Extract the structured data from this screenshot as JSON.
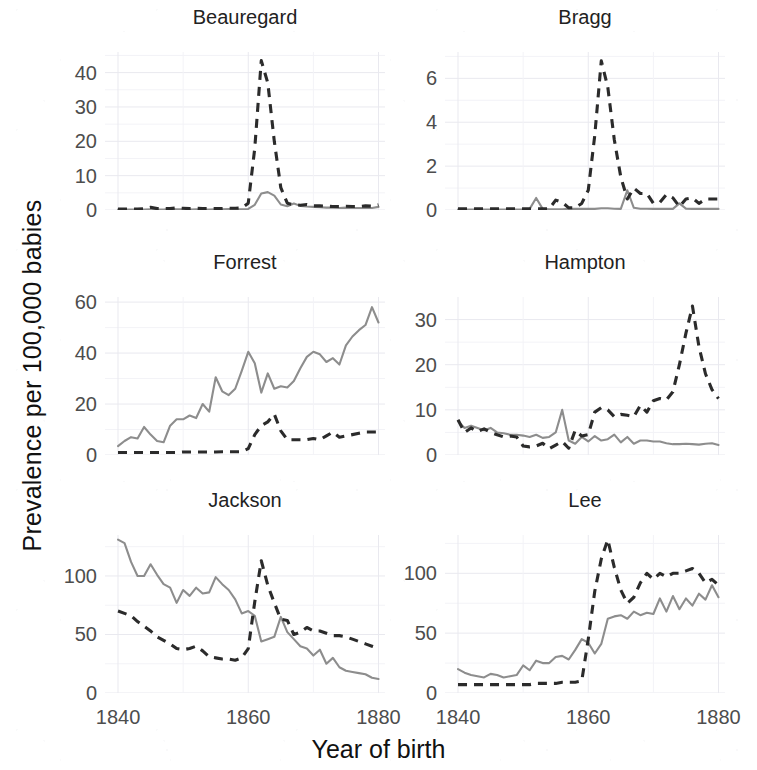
{
  "chart_data": {
    "type": "line",
    "title": "",
    "xlabel": "Year of birth",
    "ylabel": "Prevalence per 100,000 babies",
    "xlim": [
      1838,
      1881
    ],
    "xticks": [
      1840,
      1860,
      1880
    ],
    "xticklabels": [
      "1840",
      "1860",
      "1880"
    ],
    "grid": true,
    "legend_position": "none",
    "facet_layout": {
      "rows": 3,
      "cols": 2
    },
    "series_styles": [
      {
        "name": "solid-grey-series",
        "style": "solid",
        "color": "#8d8d8d"
      },
      {
        "name": "dashed-black-series",
        "style": "dashed",
        "color": "#2b2b2b"
      }
    ],
    "x": [
      1840,
      1841,
      1842,
      1843,
      1844,
      1845,
      1846,
      1847,
      1848,
      1849,
      1850,
      1851,
      1852,
      1853,
      1854,
      1855,
      1856,
      1857,
      1858,
      1859,
      1860,
      1861,
      1862,
      1863,
      1864,
      1865,
      1866,
      1867,
      1868,
      1869,
      1870,
      1871,
      1872,
      1873,
      1874,
      1875,
      1876,
      1877,
      1878,
      1879,
      1880
    ],
    "panels": [
      {
        "name": "Beauregard",
        "ylim": [
          0,
          46
        ],
        "yticks": [
          0,
          10,
          20,
          30,
          40
        ],
        "yticklabels": [
          "0",
          "10",
          "20",
          "30",
          "40"
        ],
        "series": [
          {
            "name": "solid-grey-series",
            "values": [
              0.1,
              0.1,
              0.1,
              0.1,
              0.1,
              0.2,
              0.1,
              0.1,
              0.3,
              0.2,
              0.2,
              0.1,
              0.2,
              0.1,
              0.1,
              0.2,
              0.2,
              0.3,
              0.2,
              0.2,
              0.3,
              1.5,
              4.8,
              5.2,
              4.2,
              1.6,
              1.1,
              1.9,
              1.2,
              1.0,
              0.9,
              0.8,
              0.7,
              0.7,
              0.6,
              0.7,
              0.6,
              0.6,
              0.6,
              0.6,
              0.9
            ]
          },
          {
            "name": "dashed-black-series",
            "values": [
              0.3,
              0.3,
              0.3,
              0.3,
              0.4,
              0.8,
              0.4,
              0.4,
              0.4,
              0.6,
              0.5,
              0.4,
              0.5,
              0.4,
              0.4,
              0.4,
              0.4,
              0.5,
              0.5,
              0.6,
              2.0,
              18.0,
              43.5,
              37.0,
              20.0,
              6.5,
              2.0,
              1.5,
              1.4,
              1.6,
              1.2,
              1.2,
              1.1,
              1.0,
              1.0,
              1.1,
              1.0,
              1.0,
              1.2,
              1.1,
              1.5
            ]
          }
        ]
      },
      {
        "name": "Bragg",
        "ylim": [
          0,
          7.2
        ],
        "yticks": [
          0,
          2,
          4,
          6
        ],
        "yticklabels": [
          "0",
          "2",
          "4",
          "6"
        ],
        "series": [
          {
            "name": "solid-grey-series",
            "values": [
              0.02,
              0.02,
              0.02,
              0.02,
              0.02,
              0.02,
              0.02,
              0.02,
              0.02,
              0.02,
              0.02,
              0.05,
              0.55,
              0.05,
              0.03,
              0.03,
              0.03,
              0.05,
              0.05,
              0.05,
              0.05,
              0.05,
              0.08,
              0.08,
              0.06,
              0.05,
              0.9,
              0.1,
              0.06,
              0.06,
              0.05,
              0.05,
              0.05,
              0.05,
              0.3,
              0.06,
              0.05,
              0.05,
              0.05,
              0.05,
              0.05
            ]
          },
          {
            "name": "dashed-black-series",
            "values": [
              0.05,
              0.05,
              0.05,
              0.05,
              0.05,
              0.05,
              0.05,
              0.05,
              0.05,
              0.05,
              0.05,
              0.05,
              0.05,
              0.05,
              0.05,
              0.45,
              0.35,
              0.1,
              0.1,
              0.3,
              0.9,
              3.4,
              6.8,
              5.6,
              3.2,
              1.5,
              0.5,
              1.0,
              0.75,
              0.75,
              0.3,
              0.35,
              0.7,
              0.55,
              0.15,
              0.5,
              0.55,
              0.3,
              0.5,
              0.5,
              0.5
            ]
          }
        ]
      },
      {
        "name": "Forrest",
        "ylim": [
          0,
          62
        ],
        "yticks": [
          0,
          20,
          40,
          60
        ],
        "yticklabels": [
          "0",
          "20",
          "40",
          "60"
        ],
        "series": [
          {
            "name": "solid-grey-series",
            "values": [
              3.5,
              5.5,
              7.0,
              6.5,
              11.0,
              8.0,
              5.5,
              5.0,
              11.5,
              14.0,
              14.0,
              15.5,
              14.5,
              20.0,
              17.0,
              30.5,
              25.0,
              23.5,
              26.0,
              33.0,
              40.5,
              36.0,
              24.5,
              32.0,
              26.0,
              27.0,
              26.5,
              29.0,
              34.0,
              38.5,
              40.5,
              39.5,
              36.5,
              38.0,
              35.5,
              43.0,
              46.5,
              49.0,
              51.0,
              58.0,
              52.0
            ]
          },
          {
            "name": "dashed-black-series",
            "values": [
              1.0,
              1.0,
              1.0,
              1.0,
              1.0,
              1.0,
              1.0,
              1.0,
              1.0,
              1.0,
              1.2,
              1.2,
              1.2,
              1.2,
              1.2,
              1.2,
              1.3,
              1.3,
              1.3,
              1.3,
              2.5,
              8.0,
              11.5,
              13.0,
              16.0,
              9.5,
              6.0,
              6.0,
              6.0,
              6.0,
              6.5,
              6.0,
              7.5,
              9.0,
              7.0,
              7.5,
              8.0,
              8.5,
              9.0,
              9.0,
              9.0
            ]
          }
        ]
      },
      {
        "name": "Hampton",
        "ylim": [
          0,
          35
        ],
        "yticks": [
          0,
          10,
          20,
          30
        ],
        "yticklabels": [
          "0",
          "10",
          "20",
          "30"
        ],
        "series": [
          {
            "name": "solid-grey-series",
            "values": [
              7.5,
              6.0,
              6.5,
              6.0,
              5.5,
              6.0,
              5.0,
              4.8,
              4.5,
              4.5,
              4.3,
              4.0,
              4.5,
              3.8,
              4.0,
              5.0,
              10.0,
              3.2,
              2.5,
              4.0,
              3.0,
              4.2,
              3.2,
              3.5,
              4.5,
              2.8,
              4.0,
              2.5,
              3.2,
              3.2,
              3.0,
              3.0,
              2.6,
              2.4,
              2.4,
              2.5,
              2.4,
              2.3,
              2.5,
              2.6,
              2.2
            ]
          },
          {
            "name": "dashed-black-series",
            "values": [
              7.8,
              5.0,
              6.0,
              5.2,
              5.8,
              5.0,
              4.5,
              4.0,
              4.2,
              4.0,
              2.0,
              1.8,
              2.0,
              2.6,
              1.4,
              2.2,
              3.0,
              1.5,
              5.5,
              4.2,
              4.5,
              9.5,
              10.5,
              10.0,
              8.5,
              9.0,
              8.8,
              8.5,
              11.0,
              9.5,
              12.0,
              12.5,
              12.2,
              14.0,
              20.0,
              27.0,
              33.0,
              24.0,
              18.0,
              14.5,
              12.5
            ]
          }
        ]
      },
      {
        "name": "Jackson",
        "ylim": [
          0,
          135
        ],
        "yticks": [
          0,
          50,
          100
        ],
        "yticklabels": [
          "0",
          "50",
          "100"
        ],
        "series": [
          {
            "name": "solid-grey-series",
            "values": [
              131,
              128,
              112,
              100,
              100,
              110,
              101,
              93,
              90,
              77,
              88,
              83,
              90,
              85,
              86,
              99,
              93,
              88,
              80,
              68,
              70,
              66,
              44,
              46,
              48,
              65,
              52,
              46,
              40,
              38,
              32,
              37,
              25,
              30,
              22,
              19,
              18,
              17,
              16,
              13,
              12
            ]
          },
          {
            "name": "dashed-black-series",
            "values": [
              70,
              68,
              66,
              61,
              57,
              53,
              48,
              45,
              42,
              38,
              37,
              38,
              40,
              36,
              31,
              30,
              29,
              29,
              28,
              30,
              38,
              78,
              113,
              92,
              77,
              63,
              62,
              50,
              52,
              56,
              53,
              53,
              51,
              49,
              49,
              48,
              46,
              44,
              42,
              40,
              38
            ]
          }
        ]
      },
      {
        "name": "Lee",
        "ylim": [
          0,
          132
        ],
        "yticks": [
          0,
          50,
          100
        ],
        "yticklabels": [
          "0",
          "50",
          "100"
        ],
        "series": [
          {
            "name": "solid-grey-series",
            "values": [
              20,
              17,
              15,
              14,
              13,
              16,
              15,
              13,
              14,
              15,
              23,
              19,
              27,
              25,
              25,
              30,
              31,
              28,
              36,
              45,
              42,
              33,
              41,
              62,
              64,
              65,
              62,
              68,
              65,
              67,
              66,
              79,
              68,
              81,
              70,
              79,
              73,
              83,
              78,
              90,
              80
            ]
          },
          {
            "name": "dashed-black-series",
            "values": [
              7,
              7,
              7,
              7,
              7,
              7,
              7,
              7,
              7,
              7,
              7,
              7,
              8,
              8,
              8,
              8,
              9,
              9,
              9,
              10,
              45,
              85,
              112,
              128,
              105,
              86,
              75,
              80,
              92,
              100,
              95,
              100,
              97,
              100,
              100,
              102,
              104,
              100,
              92,
              95,
              90
            ]
          }
        ]
      }
    ]
  }
}
